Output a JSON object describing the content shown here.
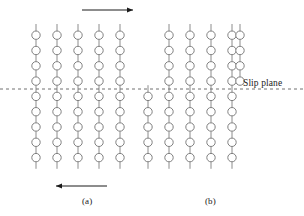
{
  "figure": {
    "title_visible": false,
    "background_color": "#ffffff",
    "atom_stroke_color": "#808080",
    "bond_stroke_color": "#8c8c8c",
    "slip_plane_color": "#707070",
    "arrow_color": "#1a1a1a",
    "text_color": "#1a1a1a"
  },
  "annotations": {
    "slip_plane_label": "Slip plane",
    "panel_a_label": "(a)",
    "panel_b_label": "(b)"
  },
  "arrows": {
    "top": {
      "name": "shear-arrow-top",
      "direction": "right",
      "x1": 82,
      "x2": 133,
      "y": 10
    },
    "bottom": {
      "name": "shear-arrow-bottom",
      "direction": "left",
      "x1": 56,
      "x2": 107,
      "y": 186
    }
  },
  "slip_plane": {
    "y": 89,
    "x1": 0,
    "x2": 304,
    "dash": "3 3"
  },
  "lattice": {
    "atom_radius": 4.2,
    "row_spacing": 15.3,
    "col_spacing": 21.0,
    "stub_length": 7.0,
    "panel_a": {
      "name": "panel-a-lattice",
      "description": "undeformed crystal, columns aligned across slip plane",
      "col_x": [
        36,
        57,
        78,
        99,
        120
      ],
      "upper_rows_y": [
        35.2,
        50.5,
        65.8,
        81.1
      ],
      "lower_rows_y": [
        96.4,
        111.7,
        127.0,
        142.3,
        157.6
      ],
      "upper_col_x": [
        36,
        57,
        78,
        99,
        120
      ],
      "lower_col_x": [
        36,
        57,
        78,
        99,
        120
      ]
    },
    "panel_b": {
      "name": "panel-b-lattice",
      "description": "slipped crystal, upper half displaced one spacing to the right",
      "upper_rows_y": [
        35.2,
        50.5,
        65.8,
        81.1
      ],
      "lower_rows_y": [
        96.4,
        111.7,
        127.0,
        142.3,
        157.6
      ],
      "upper_col_x": [
        169,
        190,
        211,
        232,
        238
      ],
      "lower_col_x": [
        148,
        169,
        190,
        211,
        232
      ],
      "upper_col_x_actual": [
        169,
        190,
        211,
        232,
        240
      ],
      "lower_col_x_actual": [
        148,
        169,
        190,
        211,
        232
      ]
    }
  }
}
